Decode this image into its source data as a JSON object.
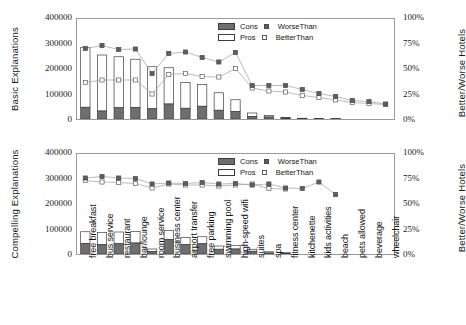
{
  "chart_data": [
    {
      "type": "bar",
      "panel": "top",
      "title": "",
      "ylabel": "Basic Explanations",
      "ylabel_right": "Better/Worse Hotels",
      "xlabel": "",
      "ylim": [
        0,
        400000
      ],
      "yticks": [
        "0",
        "100000",
        "200000",
        "300000",
        "400000"
      ],
      "ytick_values": [
        0,
        100000,
        200000,
        300000,
        400000
      ],
      "rlim": [
        0,
        1
      ],
      "rticks": [
        "0%",
        "25%",
        "50%",
        "75%",
        "100%"
      ],
      "rtick_values": [
        0,
        0.25,
        0.5,
        0.75,
        1.0
      ],
      "grid": false,
      "legend_position": "top-right",
      "categories": [
        "free breakfast",
        "bus service",
        "restaurant",
        "bar/lounge",
        "room service",
        "business center",
        "airport transfer",
        "free parking",
        "swimming pool",
        "high-speed wifi",
        "suites",
        "spa",
        "fitness center",
        "kitchenette",
        "kids activities",
        "beach",
        "pets allowed",
        "beverage",
        "wheelchair"
      ],
      "series": [
        {
          "name": "Cons",
          "type": "bar-stack",
          "values": [
            47000,
            32000,
            45000,
            46000,
            41000,
            60000,
            43000,
            51000,
            35000,
            30000,
            10000,
            8000,
            3500,
            1500,
            1200,
            900,
            700,
            500,
            400
          ]
        },
        {
          "name": "Pros",
          "type": "bar-stack",
          "values": [
            240000,
            224000,
            204000,
            193000,
            168000,
            145000,
            103000,
            87000,
            70000,
            47000,
            14000,
            6000,
            2500,
            1500,
            1000,
            800,
            600,
            400,
            300
          ]
        },
        {
          "name": "WorseThan",
          "type": "line-marker-filled",
          "values": [
            0.705,
            0.735,
            0.695,
            0.7,
            0.455,
            0.655,
            0.67,
            0.615,
            0.57,
            0.665,
            0.335,
            0.335,
            0.335,
            0.295,
            0.255,
            0.225,
            0.185,
            0.175,
            0.15
          ]
        },
        {
          "name": "BetterThan",
          "type": "line-marker-open",
          "values": [
            0.365,
            0.39,
            0.39,
            0.39,
            0.25,
            0.445,
            0.455,
            0.425,
            0.42,
            0.505,
            0.31,
            0.28,
            0.27,
            0.235,
            0.215,
            0.19,
            0.165,
            0.155,
            0.145
          ]
        }
      ]
    },
    {
      "type": "bar",
      "panel": "bottom",
      "title": "",
      "ylabel": "Compelling Explanations",
      "ylabel_right": "Better/Worse Hotels",
      "xlabel": "",
      "ylim": [
        0,
        400000
      ],
      "yticks": [
        "0",
        "100000",
        "200000",
        "300000",
        "400000"
      ],
      "ytick_values": [
        0,
        100000,
        200000,
        300000,
        400000
      ],
      "rlim": [
        0,
        1
      ],
      "rticks": [
        "0%",
        "25%",
        "50%",
        "75%",
        "100%"
      ],
      "rtick_values": [
        0,
        0.25,
        0.5,
        0.75,
        1.0
      ],
      "grid": false,
      "legend_position": "top-right",
      "categories": [
        "free breakfast",
        "bus service",
        "restaurant",
        "bar/lounge",
        "room service",
        "business center",
        "airport transfer",
        "free parking",
        "swimming pool",
        "high-speed wifi",
        "suites",
        "spa",
        "fitness center",
        "kitchenette",
        "kids activities",
        "beach",
        "pets allowed",
        "beverage",
        "wheelchair"
      ],
      "series": [
        {
          "name": "Cons",
          "type": "bar-stack",
          "values": [
            42000,
            38000,
            41000,
            44000,
            10000,
            58000,
            38000,
            41000,
            19000,
            20000,
            11000,
            4000,
            3000,
            0,
            0,
            0,
            0,
            0,
            0
          ]
        },
        {
          "name": "Pros",
          "type": "bar-stack",
          "values": [
            47000,
            48000,
            47000,
            46000,
            10000,
            36000,
            28000,
            28000,
            13000,
            14000,
            8000,
            5000,
            2000,
            0,
            0,
            0,
            0,
            0,
            0
          ]
        },
        {
          "name": "WorseThan",
          "type": "line-marker-filled",
          "values": [
            0.76,
            0.775,
            0.76,
            0.755,
            0.7,
            0.71,
            0.705,
            0.715,
            0.7,
            0.705,
            0.69,
            0.7,
            0.66,
            0.655,
            0.72,
            0.595,
            null,
            null,
            null
          ]
        },
        {
          "name": "BetterThan",
          "type": "line-marker-open",
          "values": [
            0.735,
            0.72,
            0.715,
            0.705,
            0.66,
            0.7,
            0.69,
            0.69,
            0.68,
            0.69,
            0.7,
            0.655,
            0.65,
            null,
            null,
            null,
            null,
            null,
            null
          ]
        }
      ]
    }
  ],
  "axes": {
    "top": {
      "ylabel": "Basic Explanations",
      "ylabel_right": "Better/Worse Hotels",
      "yticks": [
        "400000",
        "300000",
        "200000",
        "100000",
        "0"
      ],
      "rticks": [
        "100%",
        "75%",
        "50%",
        "25%",
        "0%"
      ]
    },
    "bottom": {
      "ylabel": "Compelling Explanations",
      "ylabel_right": "Better/Worse Hotels",
      "yticks": [
        "400000",
        "300000",
        "200000",
        "100000",
        "0"
      ],
      "rticks": [
        "100%",
        "75%",
        "50%",
        "25%",
        "0%"
      ]
    }
  },
  "legend": {
    "cons_label": "Cons",
    "pros_label": "Pros",
    "worse_label": "WorseThan",
    "better_label": "BetterThan"
  },
  "categories": [
    "free breakfast",
    "bus service",
    "restaurant",
    "bar/lounge",
    "room service",
    "business center",
    "airport transfer",
    "free parking",
    "swimming pool",
    "high-speed wifi",
    "suites",
    "spa",
    "fitness center",
    "kitchenette",
    "kids activities",
    "beach",
    "pets allowed",
    "beverage",
    "wheelchair"
  ],
  "colors": {
    "cons_fill": "#6e6e6e",
    "pros_fill": "#ffffff",
    "bar_edge": "#3c3c3c",
    "worse_marker": "#5e5e5e",
    "better_marker": "#ffffff",
    "line": "#a9a9a9",
    "frame": "#9a9a9a",
    "text": "#1a1a1a"
  }
}
